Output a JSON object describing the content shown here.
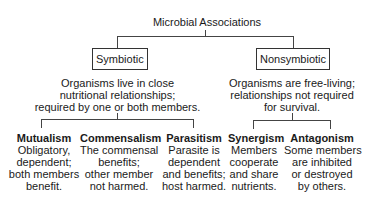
{
  "title": "Microbial Associations",
  "branches": [
    {
      "label": "Symbiotic",
      "description": [
        "Organisms live in close",
        "nutritional relationships;",
        "required by one or both members."
      ],
      "children": [
        {
          "label": "Mutualism",
          "description": [
            "Obligatory,",
            "dependent;",
            "both members",
            "benefit."
          ]
        },
        {
          "label": "Commensalism",
          "description": [
            "The commensal",
            "benefits;",
            "other member",
            "not harmed."
          ]
        },
        {
          "label": "Parasitism",
          "description": [
            "Parasite is",
            "dependent",
            "and benefits;",
            "host harmed."
          ]
        }
      ]
    },
    {
      "label": "Nonsymbiotic",
      "description": [
        "Organisms are free-living;",
        "relationships not required",
        "for survival."
      ],
      "children": [
        {
          "label": "Synergism",
          "description": [
            "Members",
            "cooperate",
            "and share",
            "nutrients."
          ]
        },
        {
          "label": "Antagonism",
          "description": [
            "Some members",
            "are inhibited",
            "or destroyed",
            "by others."
          ]
        }
      ]
    }
  ]
}
